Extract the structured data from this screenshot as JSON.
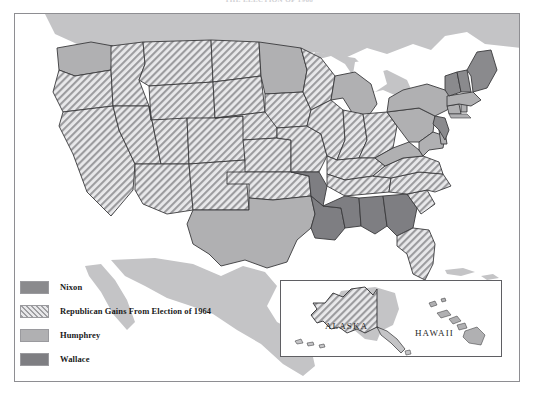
{
  "title": "THE ELECTION OF 1968",
  "frame": {
    "border_color": "#8e8e92",
    "background": "#ffffff"
  },
  "legend": {
    "items": [
      {
        "label": "Nixon",
        "swatch": "solid-dark-gray",
        "color": "#8a8a8d"
      },
      {
        "label": "Republican Gains From Election of 1964",
        "swatch": "diagonal-hatch",
        "color": "#9e9ea1"
      },
      {
        "label": "Humphrey",
        "swatch": "solid-light-gray",
        "color": "#b0b0b2"
      },
      {
        "label": "Wallace",
        "swatch": "solid-dark-gray",
        "color": "#7e7e82"
      }
    ]
  },
  "inset": {
    "alaska_label": "ALASKA",
    "hawaii_label": "HAWAII",
    "alaska_category": "Republican Gains From Election of 1964",
    "hawaii_category": "Humphrey",
    "border_color": "#5f5f63"
  },
  "map": {
    "ocean_color": "#ffffff",
    "neighbor_color": "#c4c4c6",
    "state_border_color": "#3a3a3c",
    "categories": {
      "nixon": "#8a8a8d",
      "gains": "#9e9ea1",
      "humphrey": "#b0b0b2",
      "wallace": "#7e7e82"
    },
    "state_assignments": [
      {
        "state": "Washington",
        "category": "humphrey"
      },
      {
        "state": "Oregon",
        "category": "gains"
      },
      {
        "state": "California",
        "category": "gains"
      },
      {
        "state": "Idaho",
        "category": "gains"
      },
      {
        "state": "Nevada",
        "category": "gains"
      },
      {
        "state": "Montana",
        "category": "gains"
      },
      {
        "state": "Wyoming",
        "category": "gains"
      },
      {
        "state": "Utah",
        "category": "gains"
      },
      {
        "state": "Arizona",
        "category": "gains"
      },
      {
        "state": "Colorado",
        "category": "gains"
      },
      {
        "state": "New Mexico",
        "category": "gains"
      },
      {
        "state": "North Dakota",
        "category": "gains"
      },
      {
        "state": "South Dakota",
        "category": "gains"
      },
      {
        "state": "Nebraska",
        "category": "gains"
      },
      {
        "state": "Kansas",
        "category": "gains"
      },
      {
        "state": "Oklahoma",
        "category": "gains"
      },
      {
        "state": "Texas",
        "category": "humphrey"
      },
      {
        "state": "Minnesota",
        "category": "humphrey"
      },
      {
        "state": "Iowa",
        "category": "gains"
      },
      {
        "state": "Missouri",
        "category": "gains"
      },
      {
        "state": "Arkansas",
        "category": "wallace"
      },
      {
        "state": "Louisiana",
        "category": "wallace"
      },
      {
        "state": "Wisconsin",
        "category": "gains"
      },
      {
        "state": "Illinois",
        "category": "gains"
      },
      {
        "state": "Michigan",
        "category": "humphrey"
      },
      {
        "state": "Indiana",
        "category": "gains"
      },
      {
        "state": "Ohio",
        "category": "gains"
      },
      {
        "state": "Kentucky",
        "category": "gains"
      },
      {
        "state": "Tennessee",
        "category": "gains"
      },
      {
        "state": "Mississippi",
        "category": "wallace"
      },
      {
        "state": "Alabama",
        "category": "wallace"
      },
      {
        "state": "Georgia",
        "category": "wallace"
      },
      {
        "state": "Florida",
        "category": "gains"
      },
      {
        "state": "South Carolina",
        "category": "gains"
      },
      {
        "state": "North Carolina",
        "category": "gains"
      },
      {
        "state": "Virginia",
        "category": "gains"
      },
      {
        "state": "West Virginia",
        "category": "humphrey"
      },
      {
        "state": "Maryland",
        "category": "humphrey"
      },
      {
        "state": "Delaware",
        "category": "humphrey"
      },
      {
        "state": "Pennsylvania",
        "category": "humphrey"
      },
      {
        "state": "New Jersey",
        "category": "nixon"
      },
      {
        "state": "New York",
        "category": "humphrey"
      },
      {
        "state": "Connecticut",
        "category": "humphrey"
      },
      {
        "state": "Rhode Island",
        "category": "humphrey"
      },
      {
        "state": "Massachusetts",
        "category": "humphrey"
      },
      {
        "state": "Vermont",
        "category": "nixon"
      },
      {
        "state": "New Hampshire",
        "category": "nixon"
      },
      {
        "state": "Maine",
        "category": "nixon"
      },
      {
        "state": "Alaska",
        "category": "gains"
      },
      {
        "state": "Hawaii",
        "category": "humphrey"
      }
    ]
  }
}
